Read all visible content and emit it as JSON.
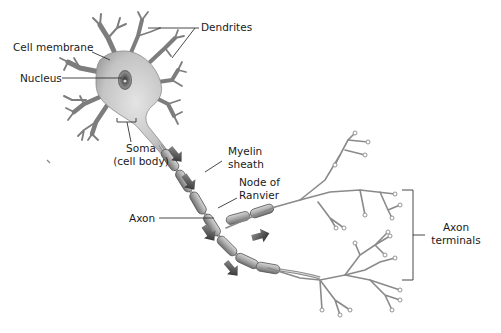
{
  "diagram": {
    "labels": {
      "dendrites": "Dendrites",
      "cell_membrane": "Cell membrane",
      "nucleus": "Nucleus",
      "soma_line1": "Soma",
      "soma_line2": "(cell body)",
      "myelin_line1": "Myelin",
      "myelin_line2": "sheath",
      "node_line1": "Node of",
      "node_line2": "Ranvier",
      "axon": "Axon",
      "terminals_line1": "Axon",
      "terminals_line2": "terminals"
    },
    "arrows": {
      "meaning": "direction of nerve impulse",
      "count": 5
    },
    "colors": {
      "cell_body": "#c8c8c8",
      "nucleus": "#555555",
      "myelin": "#9a9a9a",
      "arrow": "#2a2a2a",
      "text": "#1a1a1a",
      "background": "#ffffff"
    }
  }
}
